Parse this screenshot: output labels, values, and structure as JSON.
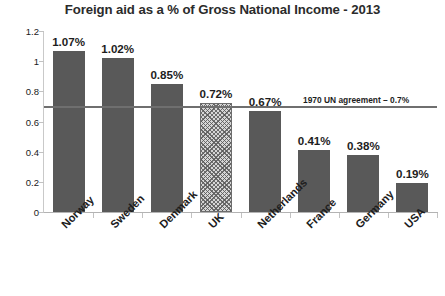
{
  "chart_data": {
    "type": "bar",
    "title": "Foreign aid as a % of Gross National Income - 2013",
    "xlabel": "",
    "ylabel": "",
    "ylim": [
      0,
      1.2
    ],
    "grid": false,
    "legend": "none",
    "categories": [
      "Norway",
      "Sweden",
      "Denmark",
      "UK",
      "Netherlands",
      "France",
      "Germany",
      "USA"
    ],
    "values": [
      1.07,
      1.02,
      0.85,
      0.72,
      0.67,
      0.41,
      0.38,
      0.19
    ],
    "value_labels": [
      "1.07%",
      "1.02%",
      "0.85%",
      "0.72%",
      "0.67%",
      "0.41%",
      "0.38%",
      "0.19%"
    ],
    "highlighted_category": "UK",
    "bar_styles": [
      "solid",
      "solid",
      "solid",
      "hatched",
      "solid",
      "solid",
      "solid",
      "solid"
    ],
    "y_ticks": [
      0,
      0.2,
      0.4,
      0.6,
      0.8,
      1,
      1.2
    ],
    "y_tick_labels": [
      "0",
      "0.2",
      "0.4",
      "0.6",
      "0.8",
      "1",
      "1.2"
    ],
    "annotation": {
      "label": "1970 UN agreement – 0.7%",
      "value": 0.7
    },
    "colors": {
      "bar_fill": "#595959",
      "hatch_fill": "#d6d6d6",
      "hatch_line": "#5a5a5a",
      "hatch_border": "#6d6d6d",
      "reference_line": "#6f6f6f",
      "axis": "#b3b3b3",
      "text": "#1d1d1d",
      "background": "#ffffff"
    }
  }
}
